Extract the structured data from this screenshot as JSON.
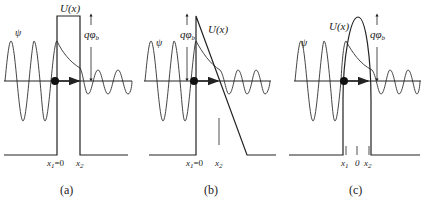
{
  "figure": {
    "panels": [
      {
        "id": "a",
        "caption": "(a)",
        "barrier_label": "U(x)",
        "wave_label": "ψ",
        "energy_label": "qφ",
        "energy_sub": "b",
        "x1_label": "x",
        "x1_sub": "1",
        "x1_suffix": "=0",
        "x2_label": "x",
        "x2_sub": "2",
        "barrier_shape": "rectangular"
      },
      {
        "id": "b",
        "caption": "(b)",
        "barrier_label": "U(x)",
        "wave_label": "ψ",
        "energy_label": "qφ",
        "energy_sub": "b",
        "x1_label": "x",
        "x1_sub": "1",
        "x1_suffix": "=0",
        "x2_label": "x",
        "x2_sub": "2",
        "barrier_shape": "triangular"
      },
      {
        "id": "c",
        "caption": "(c)",
        "barrier_label": "U(x)",
        "wave_label": "ψ",
        "energy_label": "qφ",
        "energy_sub": "b",
        "x1_label": "x",
        "x1_sub": "1",
        "zero_label": "0",
        "x2_label": "x",
        "x2_sub": "2",
        "barrier_shape": "parabolic"
      }
    ],
    "colors": {
      "line": "#222222",
      "wave": "#333333",
      "background": "#ffffff"
    }
  }
}
